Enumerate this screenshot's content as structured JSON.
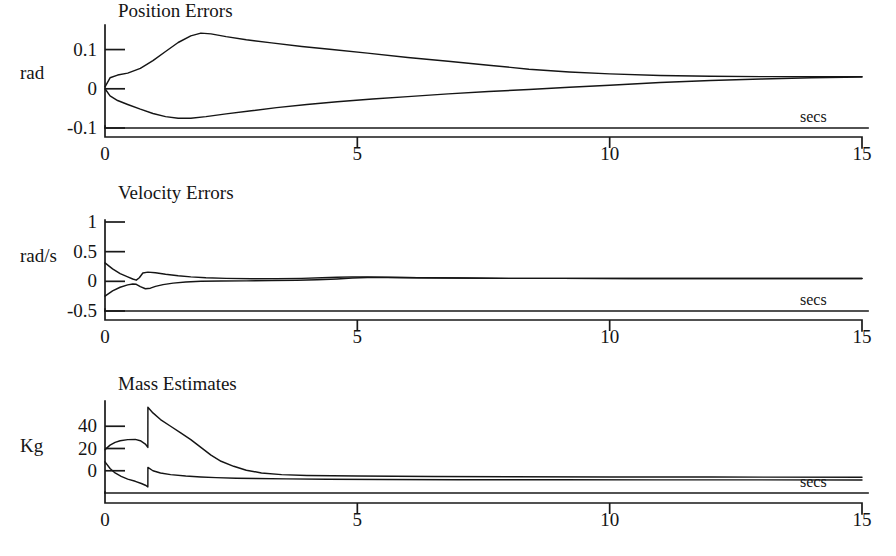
{
  "figure": {
    "background": "#ffffff",
    "ink_color": "#151515",
    "width": 896,
    "height": 556
  },
  "panels": [
    {
      "id": "position-errors",
      "title": "Position Errors",
      "y_axis_name": "rad",
      "x_axis_units": "secs"
    },
    {
      "id": "velocity-errors",
      "title": "Velocity Errors",
      "y_axis_name": "rad/s",
      "x_axis_units": "secs"
    },
    {
      "id": "mass-estimates",
      "title": "Mass Estimates",
      "y_axis_name": "Kg",
      "x_axis_units": "secs"
    }
  ],
  "chart_data": [
    {
      "type": "line",
      "id": "position-errors",
      "title": "Position Errors",
      "xlabel": "secs",
      "ylabel": "rad",
      "xlim": [
        0,
        15
      ],
      "ylim": [
        -0.1,
        0.155
      ],
      "xticks": [
        0,
        5,
        10,
        15
      ],
      "xticklabels": [
        "0",
        "5",
        "10",
        "15"
      ],
      "yticks": [
        0.1,
        0,
        -0.1
      ],
      "yticklabels": [
        "0.1",
        "0",
        "-0.1"
      ],
      "grid": false,
      "legend": "none",
      "series": [
        {
          "name": "error-upper",
          "x": [
            0.0,
            0.1,
            0.25,
            0.45,
            0.7,
            0.95,
            1.2,
            1.45,
            1.7,
            1.9,
            2.1,
            2.4,
            2.8,
            3.3,
            3.9,
            4.5,
            5.2,
            6.0,
            6.8,
            7.6,
            8.4,
            9.2,
            10.0,
            11.0,
            12.0,
            13.0,
            14.0,
            15.0
          ],
          "y": [
            0.005,
            0.028,
            0.035,
            0.04,
            0.052,
            0.072,
            0.095,
            0.118,
            0.135,
            0.142,
            0.14,
            0.133,
            0.125,
            0.117,
            0.108,
            0.1,
            0.091,
            0.08,
            0.07,
            0.06,
            0.05,
            0.043,
            0.038,
            0.034,
            0.032,
            0.031,
            0.031,
            0.031
          ]
        },
        {
          "name": "error-lower",
          "x": [
            0.0,
            0.1,
            0.25,
            0.45,
            0.7,
            0.95,
            1.2,
            1.45,
            1.7,
            2.0,
            2.4,
            2.9,
            3.4,
            4.0,
            4.6,
            5.3,
            6.0,
            6.8,
            7.6,
            8.4,
            9.2,
            10.0,
            11.0,
            12.0,
            13.0,
            14.0,
            15.0
          ],
          "y": [
            0.0,
            -0.018,
            -0.03,
            -0.04,
            -0.052,
            -0.063,
            -0.071,
            -0.075,
            -0.075,
            -0.071,
            -0.064,
            -0.056,
            -0.048,
            -0.04,
            -0.033,
            -0.026,
            -0.02,
            -0.013,
            -0.007,
            -0.002,
            0.004,
            0.009,
            0.016,
            0.021,
            0.025,
            0.028,
            0.03
          ]
        }
      ]
    },
    {
      "type": "line",
      "id": "velocity-errors",
      "title": "Velocity Errors",
      "xlabel": "secs",
      "ylabel": "rad/s",
      "xlim": [
        0,
        15
      ],
      "ylim": [
        -0.5,
        1.0
      ],
      "xticks": [
        0,
        5,
        10,
        15
      ],
      "xticklabels": [
        "0",
        "5",
        "10",
        "15"
      ],
      "yticks": [
        1,
        0.5,
        0,
        -0.5
      ],
      "yticklabels": [
        "1",
        "0.5",
        "0",
        "-0.5"
      ],
      "grid": false,
      "legend": "none",
      "series": [
        {
          "name": "vel-upper",
          "x": [
            0.0,
            0.15,
            0.3,
            0.45,
            0.55,
            0.62,
            0.68,
            0.75,
            0.85,
            1.0,
            1.2,
            1.45,
            1.7,
            2.0,
            2.4,
            2.9,
            3.4,
            3.9,
            4.3,
            4.6,
            4.9,
            5.2,
            5.6,
            6.2,
            7.0,
            8.0,
            9.0,
            10.5,
            12.0,
            13.5,
            15.0
          ],
          "y": [
            0.31,
            0.21,
            0.13,
            0.075,
            0.04,
            0.02,
            0.06,
            0.14,
            0.155,
            0.145,
            0.12,
            0.095,
            0.075,
            0.06,
            0.05,
            0.045,
            0.045,
            0.05,
            0.06,
            0.07,
            0.075,
            0.075,
            0.07,
            0.06,
            0.055,
            0.05,
            0.05,
            0.048,
            0.048,
            0.048,
            0.048
          ]
        },
        {
          "name": "vel-lower",
          "x": [
            0.0,
            0.15,
            0.3,
            0.45,
            0.55,
            0.62,
            0.7,
            0.8,
            0.9,
            1.0,
            1.15,
            1.35,
            1.6,
            1.9,
            2.3,
            2.8,
            3.3,
            3.8,
            4.2,
            4.6,
            4.9,
            5.2,
            5.6,
            6.2,
            7.0,
            8.0,
            9.0,
            10.5,
            12.0,
            13.5,
            15.0
          ],
          "y": [
            -0.25,
            -0.16,
            -0.1,
            -0.06,
            -0.045,
            -0.05,
            -0.09,
            -0.125,
            -0.115,
            -0.085,
            -0.055,
            -0.03,
            -0.012,
            0.0,
            0.005,
            0.008,
            0.012,
            0.018,
            0.026,
            0.04,
            0.055,
            0.065,
            0.065,
            0.06,
            0.055,
            0.05,
            0.05,
            0.048,
            0.048,
            0.048,
            0.048
          ]
        }
      ]
    },
    {
      "type": "line",
      "id": "mass-estimates",
      "title": "Mass Estimates",
      "xlabel": "secs",
      "ylabel": "Kg",
      "xlim": [
        0,
        15
      ],
      "ylim": [
        -20,
        60
      ],
      "xticks": [
        0,
        5,
        10,
        15
      ],
      "xticklabels": [
        "0",
        "5",
        "10",
        "15"
      ],
      "yticks": [
        40,
        20,
        0
      ],
      "yticklabels": [
        "40",
        "20",
        "0"
      ],
      "grid": false,
      "legend": "none",
      "note": "Both estimates show a discontinuous jump at t = 0.85 s",
      "series": [
        {
          "name": "mass-estimate-1",
          "x": [
            0.0,
            0.1,
            0.2,
            0.3,
            0.45,
            0.6,
            0.7,
            0.8,
            0.849,
            0.85,
            0.95,
            1.1,
            1.3,
            1.5,
            1.7,
            1.9,
            2.1,
            2.3,
            2.55,
            2.8,
            3.1,
            3.5,
            4.0,
            5.0,
            6.5,
            8.0,
            10.0,
            12.0,
            15.0
          ],
          "y": [
            19.0,
            23.0,
            25.5,
            27.0,
            28.0,
            28.2,
            27.0,
            24.0,
            21.0,
            57.0,
            52.0,
            46.0,
            40.0,
            34.0,
            28.0,
            21.0,
            14.0,
            8.5,
            4.0,
            0.5,
            -2.0,
            -3.5,
            -4.2,
            -4.8,
            -5.2,
            -5.4,
            -5.6,
            -5.7,
            -5.8
          ]
        },
        {
          "name": "mass-estimate-2",
          "x": [
            0.0,
            0.1,
            0.2,
            0.32,
            0.45,
            0.6,
            0.72,
            0.8,
            0.849,
            0.85,
            0.95,
            1.1,
            1.3,
            1.6,
            1.9,
            2.2,
            2.6,
            3.0,
            3.6,
            4.4,
            5.5,
            7.0,
            9.0,
            11.0,
            13.0,
            15.0
          ],
          "y": [
            8.0,
            2.0,
            -2.0,
            -5.0,
            -7.5,
            -9.5,
            -11.5,
            -13.0,
            -14.5,
            3.0,
            0.0,
            -2.0,
            -3.5,
            -4.8,
            -5.6,
            -6.2,
            -6.7,
            -7.0,
            -7.3,
            -7.6,
            -7.8,
            -8.0,
            -8.1,
            -8.2,
            -8.2,
            -8.3
          ]
        }
      ]
    }
  ]
}
